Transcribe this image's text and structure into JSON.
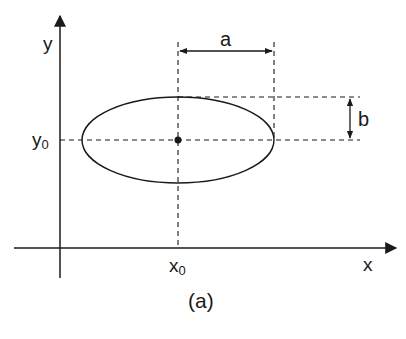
{
  "figure": {
    "caption": "(a)",
    "axes": {
      "x_label": "x",
      "y_label": "y"
    },
    "center": {
      "x_label": "x",
      "x_sub": "0",
      "y_label": "y",
      "y_sub": "0"
    },
    "dimensions": {
      "semi_major_label": "a",
      "semi_minor_label": "b"
    },
    "colors": {
      "ink": "#1a1a1a",
      "background": "#ffffff"
    }
  }
}
